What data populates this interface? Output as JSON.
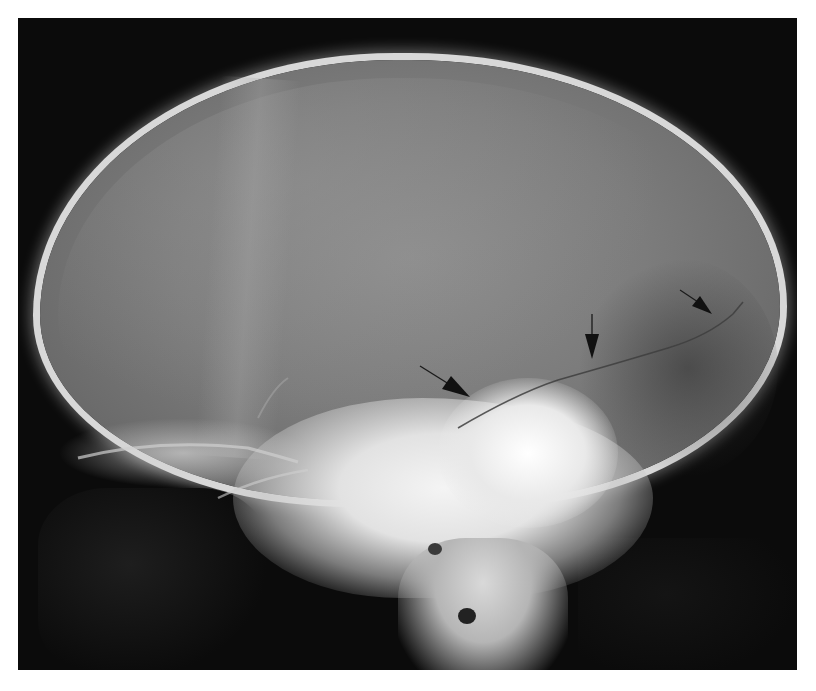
{
  "image": {
    "description": "Lateral skull radiograph (X-ray) showing a linear fracture line traversing the parietal/temporal region",
    "background_color": "#ffffff",
    "film_color": "#0b0b0b",
    "annotations": {
      "arrow_count": 3,
      "arrow_color": "#111111",
      "arrows": [
        {
          "name": "arrow-lower-left",
          "tip": [
            468,
            396
          ],
          "direction": "down-right"
        },
        {
          "name": "arrow-middle",
          "tip": [
            592,
            360
          ],
          "direction": "down"
        },
        {
          "name": "arrow-upper-right",
          "tip": [
            710,
            316
          ],
          "direction": "down-right"
        }
      ]
    }
  }
}
